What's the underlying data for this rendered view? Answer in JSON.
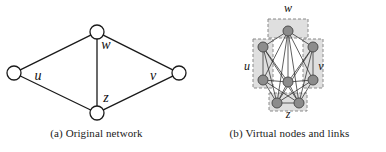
{
  "figure": {
    "background_color": "#ffffff",
    "panels": [
      {
        "id": "a",
        "caption": "(a) Original network",
        "description": "Original network with four nodes in a rhombus layout"
      },
      {
        "id": "b",
        "caption": "(b) Virtual nodes and links",
        "description": "Each original node expanded into virtual nodes grouped by dashed boxes"
      }
    ]
  },
  "panel_a": {
    "caption": "(a) Original network",
    "node_stroke_color": "#1a1a1a",
    "node_fill_color": "#ffffff",
    "edge_color": "#1a1a1a",
    "nodes": [
      {
        "id": "w",
        "label": "w",
        "cx": 97,
        "cy": 32,
        "r": 7,
        "label_x": 106,
        "label_y": 49
      },
      {
        "id": "u",
        "label": "u",
        "cx": 14,
        "cy": 73,
        "r": 7,
        "label_x": 38,
        "label_y": 80
      },
      {
        "id": "v",
        "label": "v",
        "cx": 179,
        "cy": 73,
        "r": 7,
        "label_x": 153,
        "label_y": 80
      },
      {
        "id": "z",
        "label": "z",
        "cx": 97,
        "cy": 113,
        "r": 7,
        "label_x": 106,
        "label_y": 102
      }
    ],
    "edges": [
      {
        "from": "u",
        "to": "w"
      },
      {
        "from": "w",
        "to": "v"
      },
      {
        "from": "u",
        "to": "z"
      },
      {
        "from": "z",
        "to": "v"
      },
      {
        "from": "w",
        "to": "z"
      }
    ]
  },
  "panel_b": {
    "caption": "(b) Virtual nodes and links",
    "node_fill_color": "#8c8c8c",
    "node_stroke_color": "#4d4d4d",
    "box_fill_color": "#d9d9d9",
    "box_stroke_color": "#8a8a8a",
    "edge_color": "#2b2b2b",
    "groups": [
      {
        "id": "w",
        "label": "w",
        "label_x": 47,
        "label_y": 12,
        "box": {
          "x": 27,
          "y": 19,
          "w": 40,
          "h": 19
        },
        "nodes": [
          {
            "id": "w1",
            "cx": 47,
            "cy": 31,
            "r": 5
          }
        ]
      },
      {
        "id": "u",
        "label": "u",
        "label_x": 6,
        "label_y": 70,
        "box": {
          "x": 12,
          "y": 39,
          "w": 20,
          "h": 49
        },
        "nodes": [
          {
            "id": "u1",
            "cx": 22,
            "cy": 47,
            "r": 5
          },
          {
            "id": "u2",
            "cx": 22,
            "cy": 80,
            "r": 5
          }
        ]
      },
      {
        "id": "v",
        "label": "v",
        "label_x": 80,
        "label_y": 70,
        "box": {
          "x": 62,
          "y": 39,
          "w": 20,
          "h": 49
        },
        "nodes": [
          {
            "id": "v1",
            "cx": 72,
            "cy": 47,
            "r": 5
          },
          {
            "id": "v2",
            "cx": 72,
            "cy": 80,
            "r": 5
          }
        ]
      },
      {
        "id": "z",
        "label": "z",
        "label_x": 47,
        "label_y": 118,
        "box": {
          "x": 28,
          "y": 93,
          "w": 38,
          "h": 18
        },
        "nodes": [
          {
            "id": "z0",
            "cx": 47,
            "cy": 82,
            "r": 5
          },
          {
            "id": "z1",
            "cx": 36,
            "cy": 103,
            "r": 5
          },
          {
            "id": "z2",
            "cx": 58,
            "cy": 103,
            "r": 5
          }
        ]
      }
    ],
    "edges": [
      {
        "from": "w1",
        "to": "u1"
      },
      {
        "from": "w1",
        "to": "u2"
      },
      {
        "from": "w1",
        "to": "v1"
      },
      {
        "from": "w1",
        "to": "v2"
      },
      {
        "from": "w1",
        "to": "z0"
      },
      {
        "from": "w1",
        "to": "z1"
      },
      {
        "from": "w1",
        "to": "z2"
      },
      {
        "from": "u1",
        "to": "z0"
      },
      {
        "from": "u1",
        "to": "z1"
      },
      {
        "from": "u1",
        "to": "z2"
      },
      {
        "from": "u2",
        "to": "z0"
      },
      {
        "from": "u2",
        "to": "z1"
      },
      {
        "from": "u2",
        "to": "z2"
      },
      {
        "from": "v1",
        "to": "z0"
      },
      {
        "from": "v1",
        "to": "z1"
      },
      {
        "from": "v1",
        "to": "z2"
      },
      {
        "from": "v2",
        "to": "z0"
      },
      {
        "from": "v2",
        "to": "z1"
      },
      {
        "from": "v2",
        "to": "z2"
      },
      {
        "from": "u1",
        "to": "u2"
      },
      {
        "from": "v1",
        "to": "v2"
      },
      {
        "from": "z1",
        "to": "z2"
      },
      {
        "from": "z0",
        "to": "z1"
      },
      {
        "from": "z0",
        "to": "z2"
      }
    ]
  }
}
